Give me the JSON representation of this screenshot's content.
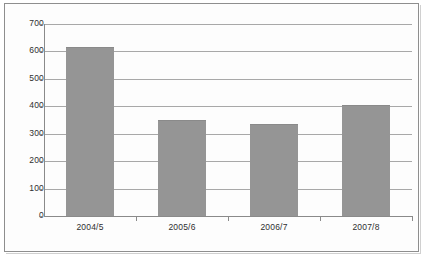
{
  "chart_data": {
    "type": "bar",
    "title": "",
    "subtitle": "",
    "xlabel": "",
    "ylabel": "",
    "categories": [
      "2004/5",
      "2005/6",
      "2006/7",
      "2007/8"
    ],
    "values": [
      615,
      350,
      337,
      405
    ],
    "series": [
      {
        "name": "",
        "values": [
          615,
          350,
          337,
          405
        ]
      }
    ],
    "ylim": [
      0,
      700
    ],
    "ytick_labels": [
      "700",
      "600",
      "500",
      "400",
      "300",
      "200",
      "100",
      "0"
    ],
    "ytick_values": [
      700,
      600,
      500,
      400,
      300,
      200,
      100,
      0
    ],
    "ytick_step": 100,
    "grid": true,
    "grid_axis": "y",
    "legend": false,
    "legend_position": "none",
    "annotations": [],
    "colors": {
      "bar_fill": "#959595",
      "bar_border": "#8a8a8a",
      "gridline": "#a8a8a8",
      "axis": "#8a8a8a",
      "tick_text": "#2f2f2f",
      "frame_border": "#8e8e8e",
      "background": "#fdfdfd"
    }
  }
}
